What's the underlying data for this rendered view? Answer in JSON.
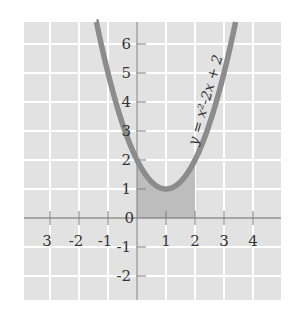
{
  "chart_data": {
    "type": "line",
    "title": "",
    "function_label": "y = x²-2x + 2",
    "equation": "y = x^2 - 2x + 2",
    "series": [
      {
        "name": "y = x²-2x + 2",
        "x": [
          -0.5,
          0,
          0.5,
          1,
          1.5,
          2,
          2.5,
          3,
          3.5
        ],
        "values": [
          3.25,
          2,
          1.25,
          1,
          1.25,
          2,
          3.25,
          5,
          7.25
        ]
      }
    ],
    "shaded_region": {
      "x_from": 0,
      "x_to": 2,
      "description": "area under curve from x=0 to x=2"
    },
    "x_ticks": [
      "3",
      "-2",
      "-1",
      "1",
      "2",
      "3",
      "4"
    ],
    "x_tick_values": [
      -3,
      -2,
      -1,
      1,
      2,
      3,
      4
    ],
    "y_ticks": [
      "6",
      "5",
      "4",
      "3",
      "2",
      "1",
      "-1",
      "-2"
    ],
    "y_tick_values": [
      6,
      5,
      4,
      3,
      2,
      1,
      -1,
      -2
    ],
    "origin_label": "0",
    "xlim": [
      -4,
      5
    ],
    "ylim": [
      -3,
      7
    ],
    "grid": true,
    "xlabel": "",
    "ylabel": ""
  },
  "colors": {
    "background": "#e2e2e2",
    "grid": "#ffffff",
    "axis": "#8a8a8a",
    "curve": "#8c8c8c",
    "shade": "#bdbdbd",
    "text": "#333333"
  }
}
